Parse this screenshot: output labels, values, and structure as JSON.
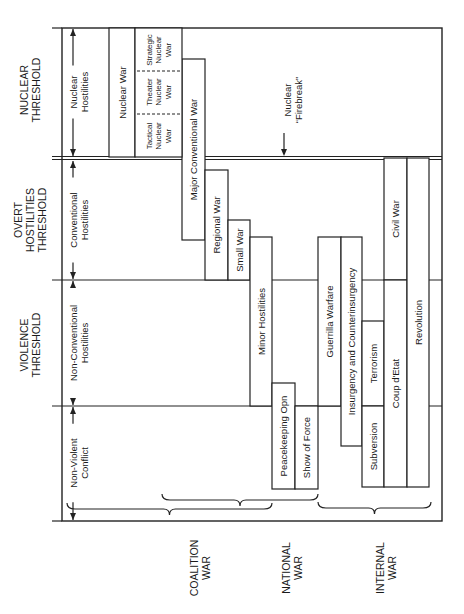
{
  "frame": {
    "x1": 62,
    "y1": 28,
    "x2": 442,
    "y2": 521
  },
  "thresholds": [
    {
      "id": "nuclear",
      "label_lines": [
        "NUCLEAR",
        "THRESHOLD"
      ],
      "y": 158,
      "double": true,
      "label_y": 90
    },
    {
      "id": "overt-hostilities",
      "label_lines": [
        "OVERT",
        "HOSTILITIES",
        "THRESHOLD"
      ],
      "y": 280,
      "double": false,
      "label_y": 220
    },
    {
      "id": "violence",
      "label_lines": [
        "VIOLENCE",
        "THRESHOLD"
      ],
      "y": 406,
      "double": false,
      "label_y": 345
    }
  ],
  "ranges": [
    {
      "id": "nuclear-hostilities",
      "lines": [
        "Nuclear",
        "Hostilities"
      ],
      "y_top": 28,
      "y_bot": 157,
      "text_y": 92
    },
    {
      "id": "conventional-hostilities",
      "lines": [
        "Conventional",
        "Hostilities"
      ],
      "y_top": 160,
      "y_bot": 280,
      "text_y": 220
    },
    {
      "id": "non-conventional-hostilities",
      "lines": [
        "Non-Conventional",
        "Hostilities"
      ],
      "y_top": 280,
      "y_bot": 406,
      "text_y": 343
    },
    {
      "id": "non-violent-conflict",
      "lines": [
        "Non-Violent",
        "Conflict"
      ],
      "y_top": 406,
      "y_bot": 521,
      "text_y": 463
    }
  ],
  "boxes": [
    {
      "id": "nuclear-war",
      "lines": [
        "Nuclear War"
      ],
      "x1": 109,
      "x2": 135,
      "y1": 28,
      "y2": 157
    },
    {
      "id": "major-conventional-war",
      "lines": [
        "Major Conventional War"
      ],
      "x1": 182,
      "x2": 205,
      "y1": 59,
      "y2": 240
    },
    {
      "id": "regional-war",
      "lines": [
        "Regional War"
      ],
      "x1": 205,
      "x2": 228,
      "y1": 170,
      "y2": 280
    },
    {
      "id": "small-war",
      "lines": [
        "Small War"
      ],
      "x1": 228,
      "x2": 250,
      "y1": 220,
      "y2": 280
    },
    {
      "id": "minor-hostilities",
      "lines": [
        "Minor Hostilities"
      ],
      "x1": 250,
      "x2": 272,
      "y1": 237,
      "y2": 406
    },
    {
      "id": "peacekeeping-opn",
      "lines": [
        "Peacekeeping Opn"
      ],
      "x1": 272,
      "x2": 295,
      "y1": 383,
      "y2": 489
    },
    {
      "id": "show-of-force",
      "lines": [
        "Show of Force"
      ],
      "x1": 295,
      "x2": 318,
      "y1": 406,
      "y2": 489
    },
    {
      "id": "guerrilla-warfare",
      "lines": [
        "Guerrilla Warfare"
      ],
      "x1": 318,
      "x2": 341,
      "y1": 237,
      "y2": 406
    },
    {
      "id": "insurgency-counterinsurgency",
      "lines": [
        "Insurgency and Counterinsurgency"
      ],
      "x1": 341,
      "x2": 362,
      "y1": 237,
      "y2": 446
    },
    {
      "id": "terrorism",
      "lines": [
        "Terrorism"
      ],
      "x1": 362,
      "x2": 384,
      "y1": 321,
      "y2": 406
    },
    {
      "id": "subversion",
      "lines": [
        "Subversion"
      ],
      "x1": 362,
      "x2": 384,
      "y1": 406,
      "y2": 487
    },
    {
      "id": "civil-war",
      "lines": [
        "Civil War"
      ],
      "x1": 384,
      "x2": 407,
      "y1": 158,
      "y2": 280
    },
    {
      "id": "coup-detat",
      "lines": [
        "Coup d'Etat"
      ],
      "x1": 384,
      "x2": 407,
      "y1": 280,
      "y2": 487
    },
    {
      "id": "revolution",
      "lines": [
        "Revolution"
      ],
      "x1": 407,
      "x2": 429,
      "y1": 158,
      "y2": 487
    }
  ],
  "nuclear_subdivisions": {
    "x1": 135,
    "x2": 182,
    "y1": 28,
    "y2": 157,
    "dash_ys": [
      71,
      114
    ],
    "items": [
      {
        "id": "strategic-nuclear-war",
        "lines": [
          "Strategic",
          "Nuclear",
          "War"
        ],
        "y": 50
      },
      {
        "id": "theater-nuclear-war",
        "lines": [
          "Theater",
          "Nuclear",
          "War"
        ],
        "y": 92
      },
      {
        "id": "tactical-nuclear-war",
        "lines": [
          "Tactical",
          "Nuclear",
          "War"
        ],
        "y": 136
      }
    ]
  },
  "firebreak": {
    "lines": [
      "Nuclear",
      "“Firebreak”"
    ],
    "x": 284,
    "arrow_y1": 133,
    "arrow_y2": 156
  },
  "braces": [
    {
      "id": "coalition-war-brace",
      "y_from": 456,
      "y_to": 310,
      "x": 239
    },
    {
      "id": "national-war-brace",
      "y_from": 319,
      "y_to": 216,
      "x": 263
    },
    {
      "id": "internal-war-brace",
      "y_from": 549,
      "y_to": 333,
      "x": 289
    }
  ],
  "categories": [
    {
      "id": "coalition-war",
      "lines": [
        "COALITION",
        "WAR"
      ],
      "x": 200,
      "y": 568
    },
    {
      "id": "national-war",
      "lines": [
        "NATIONAL",
        "WAR"
      ],
      "x": 292,
      "y": 568
    },
    {
      "id": "internal-war",
      "lines": [
        "INTERNAL",
        "WAR"
      ],
      "x": 386,
      "y": 568
    }
  ]
}
